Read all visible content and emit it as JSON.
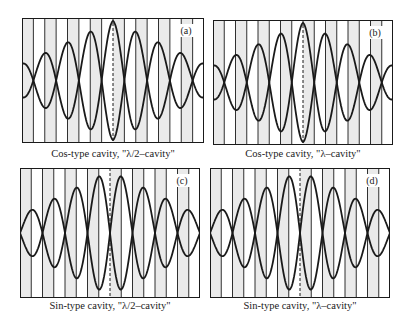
{
  "figure": {
    "panels": [
      {
        "id": "a",
        "label": "(a)",
        "caption": "Cos-type cavity, \"λ/2–cavity\"",
        "type": "cos",
        "cavity": "λ/2",
        "box": {
          "x": 22,
          "y": 18,
          "w": 182,
          "h": 125
        },
        "caption_pos": {
          "x": 113,
          "y": 148
        }
      },
      {
        "id": "b",
        "label": "(b)",
        "caption": "Cos-type cavity, \"λ–cavity\"",
        "type": "cos",
        "cavity": "λ",
        "box": {
          "x": 213,
          "y": 20,
          "w": 180,
          "h": 125
        },
        "caption_pos": {
          "x": 303,
          "y": 148
        }
      },
      {
        "id": "c",
        "label": "(c)",
        "caption": "Sin-type cavity, \"λ/2–cavity\"",
        "type": "sin",
        "cavity": "λ/2",
        "box": {
          "x": 20,
          "y": 168,
          "w": 180,
          "h": 130
        },
        "caption_pos": {
          "x": 110,
          "y": 300
        }
      },
      {
        "id": "d",
        "label": "(d)",
        "caption": "Sin-type cavity, \"λ–cavity\"",
        "type": "sin",
        "cavity": "λ",
        "box": {
          "x": 210,
          "y": 168,
          "w": 180,
          "h": 130
        },
        "caption_pos": {
          "x": 300,
          "y": 300
        }
      }
    ],
    "colors": {
      "line": "#1a1a1a",
      "shade": "#d9d9d9",
      "background": "#ffffff"
    }
  }
}
